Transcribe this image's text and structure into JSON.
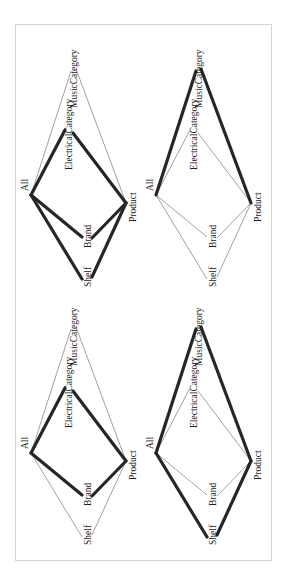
{
  "figure": {
    "panels": [
      {
        "id": "top-left",
        "offset": [
          0,
          0
        ],
        "highlighted_edges": [
          "All-ElectricalCategory",
          "ElectricalCategory-Product",
          "All-Brand",
          "Brand-Product",
          "All-Shelf",
          "Shelf-Product"
        ]
      },
      {
        "id": "top-right",
        "offset": [
          125,
          0
        ],
        "highlighted_edges": [
          "All-MusicCategory",
          "MusicCategory-Product"
        ]
      },
      {
        "id": "bottom-left",
        "offset": [
          0,
          258
        ],
        "highlighted_edges": [
          "All-ElectricalCategory",
          "ElectricalCategory-Product",
          "All-Brand",
          "Brand-Product"
        ]
      },
      {
        "id": "bottom-right",
        "offset": [
          125,
          258
        ],
        "highlighted_edges": [
          "All-MusicCategory",
          "MusicCategory-Product",
          "All-Shelf",
          "Shelf-Product"
        ]
      }
    ],
    "nodes": {
      "All": {
        "label": "All",
        "in": [
          31,
          195
        ],
        "out": [
          31,
          195
        ],
        "label_pos": [
          28,
          191
        ]
      },
      "ElectricalCategory": {
        "label": "ElectricalCategory",
        "in": [
          65,
          130
        ],
        "out": [
          73,
          133
        ],
        "label_pos": [
          72,
          170
        ]
      },
      "MusicCategory": {
        "label": "MusicCategory",
        "in": [
          71,
          71
        ],
        "out": [
          76,
          69
        ],
        "label_pos": [
          77,
          108
        ]
      },
      "Product": {
        "label": "Product",
        "in": [
          126,
          203
        ],
        "out": [
          126,
          203
        ],
        "label_pos": [
          136,
          222
        ]
      },
      "Brand": {
        "label": "Brand",
        "in": [
          82,
          237
        ],
        "out": [
          92,
          238
        ],
        "label_pos": [
          91,
          248
        ]
      },
      "Shelf": {
        "label": "Shelf",
        "in": [
          82,
          279
        ],
        "out": [
          92,
          277
        ],
        "label_pos": [
          91,
          287
        ]
      }
    },
    "edges": [
      {
        "id": "All-ElectricalCategory",
        "from": "All",
        "to": "ElectricalCategory"
      },
      {
        "id": "All-MusicCategory",
        "from": "All",
        "to": "MusicCategory"
      },
      {
        "id": "All-Brand",
        "from": "All",
        "to": "Brand"
      },
      {
        "id": "All-Shelf",
        "from": "All",
        "to": "Shelf"
      },
      {
        "id": "ElectricalCategory-Product",
        "from": "ElectricalCategory",
        "to": "Product"
      },
      {
        "id": "MusicCategory-Product",
        "from": "MusicCategory",
        "to": "Product"
      },
      {
        "id": "Brand-Product",
        "from": "Brand",
        "to": "Product"
      },
      {
        "id": "Shelf-Product",
        "from": "Shelf",
        "to": "Product"
      }
    ]
  }
}
